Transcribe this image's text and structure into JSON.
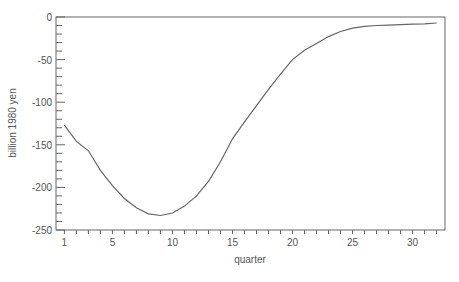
{
  "chart_data": {
    "type": "line",
    "title": "",
    "xlabel": "quarter",
    "ylabel": "billion 1980 yen",
    "xlim": [
      0.3,
      32.7
    ],
    "ylim": [
      -250,
      0
    ],
    "grid": false,
    "legend": null,
    "x_ticks": [
      1,
      5,
      10,
      15,
      20,
      25,
      30
    ],
    "y_ticks": [
      0,
      -50,
      -100,
      -150,
      -200,
      -250
    ],
    "x": [
      1,
      2,
      3,
      4,
      5,
      6,
      7,
      8,
      9,
      10,
      11,
      12,
      13,
      14,
      15,
      16,
      17,
      18,
      19,
      20,
      21,
      22,
      23,
      24,
      25,
      26,
      27,
      28,
      29,
      30,
      31,
      32
    ],
    "series": [
      {
        "name": "response",
        "color": "#666666",
        "values": [
          -127,
          -146,
          -157,
          -180,
          -198,
          -213,
          -224,
          -231,
          -233,
          -230,
          -222,
          -210,
          -193,
          -170,
          -143,
          -123,
          -104,
          -85,
          -67,
          -50,
          -39,
          -31,
          -23,
          -17,
          -13,
          -11,
          -10,
          -9.5,
          -9,
          -8.5,
          -8,
          -7
        ]
      }
    ]
  }
}
